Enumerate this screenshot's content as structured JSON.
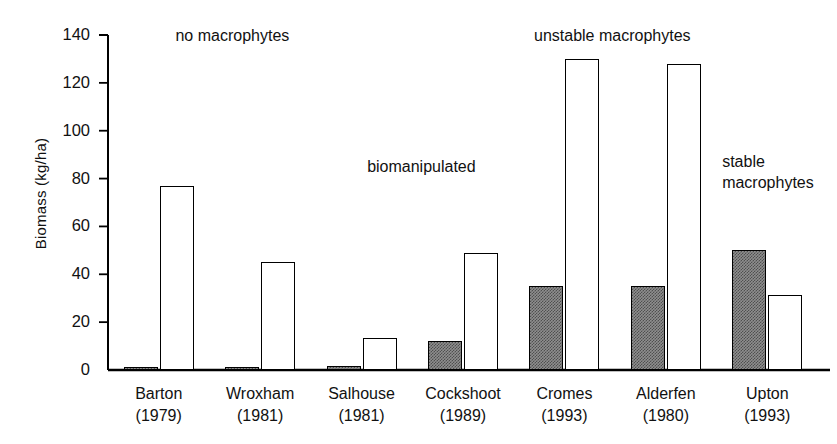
{
  "chart_data": {
    "type": "bar",
    "title": "",
    "xlabel": "",
    "ylabel": "Biomass (kg/ha)",
    "ylim": [
      0,
      140
    ],
    "yticks": [
      0,
      20,
      40,
      60,
      80,
      100,
      120,
      140
    ],
    "ytick_labels": [
      "0",
      "20",
      "40",
      "60",
      "80",
      "100",
      "120",
      "140"
    ],
    "grid": false,
    "legend": "none",
    "categories": [
      "Barton\n(1979)",
      "Wroxham\n(1981)",
      "Salhouse\n(1981)",
      "Cockshoot\n(1989)",
      "Cromes\n(1993)",
      "Alderfen\n(1980)",
      "Upton\n(1993)"
    ],
    "category_names": [
      "Barton",
      "Wroxham",
      "Salhouse",
      "Cockshoot",
      "Cromes",
      "Alderfen",
      "Upton"
    ],
    "category_years": [
      "(1979)",
      "(1981)",
      "(1981)",
      "(1989)",
      "(1993)",
      "(1980)",
      "(1993)"
    ],
    "series": [
      {
        "name": "shaded",
        "style": "shaded",
        "color": "#8e8e8e",
        "values": [
          0.5,
          0.5,
          1.5,
          12,
          35,
          35,
          50
        ]
      },
      {
        "name": "open",
        "style": "open",
        "color": "#ffffff",
        "values": [
          77,
          45,
          13.5,
          49,
          130,
          128,
          31.5
        ]
      }
    ],
    "annotations": [
      {
        "text": "no macrophytes",
        "x_pct": 9.5,
        "y_value": 141
      },
      {
        "text": "biomanipulated",
        "x_pct": 36.5,
        "y_value": 86
      },
      {
        "text": "unstable macrophytes",
        "x_pct": 60.0,
        "y_value": 141
      },
      {
        "text": "stable macrophytes",
        "x_pct": 86.5,
        "y_value": 88
      }
    ]
  },
  "style": {
    "axis_color": "#000000",
    "text_color": "#111111",
    "background": "#ffffff",
    "bar_edge_color": "#000000",
    "shaded_fill": "#8e8e8e"
  }
}
